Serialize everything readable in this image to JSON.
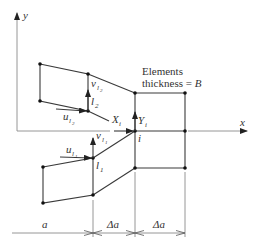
{
  "diagram": {
    "axes": {
      "x_label": "x",
      "y_label": "y"
    },
    "annotation": {
      "line1": "Elements",
      "line2_prefix": "thickness = ",
      "line2_var": "B"
    },
    "nodes": {
      "i": {
        "label": "i",
        "force_x": "X",
        "force_x_sub": "i",
        "force_y": "Y",
        "force_y_sub": "i"
      },
      "l1": {
        "label": "l",
        "label_sub": "1",
        "disp_u": "u",
        "disp_u_sub": "l",
        "disp_u_subsub": "1",
        "disp_v": "v",
        "disp_v_sub": "l",
        "disp_v_subsub": "1"
      },
      "l2": {
        "label": "l",
        "label_sub": "2",
        "disp_u": "u",
        "disp_u_sub": "l",
        "disp_u_subsub": "2",
        "disp_v": "v",
        "disp_v_sub": "l",
        "disp_v_subsub": "2"
      }
    },
    "dimensions": [
      {
        "label": "a"
      },
      {
        "label": "Δa"
      },
      {
        "label": "Δa"
      }
    ]
  }
}
